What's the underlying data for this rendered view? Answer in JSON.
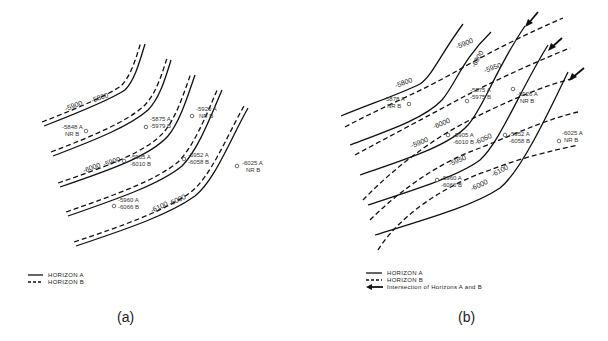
{
  "panels": [
    {
      "id": "a",
      "caption": "(a)",
      "contour_labels": [
        "-5900",
        "-5800",
        "-6000",
        "-5900",
        "-6100",
        "-6000"
      ],
      "wells": [
        {
          "a": "-5848 A",
          "b": "NR   B"
        },
        {
          "a": "-5875 A",
          "b": "-5979 B"
        },
        {
          "a": "-5920 A",
          "b": "NR   B"
        },
        {
          "a": "-5905 A",
          "b": "-6010 B"
        },
        {
          "a": "-5952 A",
          "b": "-6058 B"
        },
        {
          "a": "-6025 A",
          "b": "NR   B"
        },
        {
          "a": "-5960 A",
          "b": "-6066 B"
        }
      ],
      "legend": [
        {
          "style": "solid",
          "label": "HORIZON A"
        },
        {
          "style": "dashed",
          "label": "HORIZON B"
        }
      ]
    },
    {
      "id": "b",
      "caption": "(b)",
      "contour_labels": [
        "-5800",
        "-5900",
        "-6000",
        "-5950",
        "-6000",
        "-5900",
        "-6050",
        "-5950",
        "-6100",
        "-6000"
      ],
      "wells": [
        {
          "a": "-5878 A",
          "b": "NR   B"
        },
        {
          "a": "-5875 A",
          "b": "-5975 B"
        },
        {
          "a": "-5926 A",
          "b": "NR   B"
        },
        {
          "a": "-5905 A",
          "b": "-6010 B"
        },
        {
          "a": "-5952 A",
          "b": "-6058 B"
        },
        {
          "a": "-6025 A",
          "b": "NR   B"
        },
        {
          "a": "-5960 A",
          "b": "-6066 B"
        }
      ],
      "legend": [
        {
          "style": "solid",
          "label": "HORIZON A"
        },
        {
          "style": "dashed",
          "label": "HORIZON B"
        },
        {
          "style": "arrow",
          "label": "Intersection of Horizons A and B"
        }
      ]
    }
  ]
}
